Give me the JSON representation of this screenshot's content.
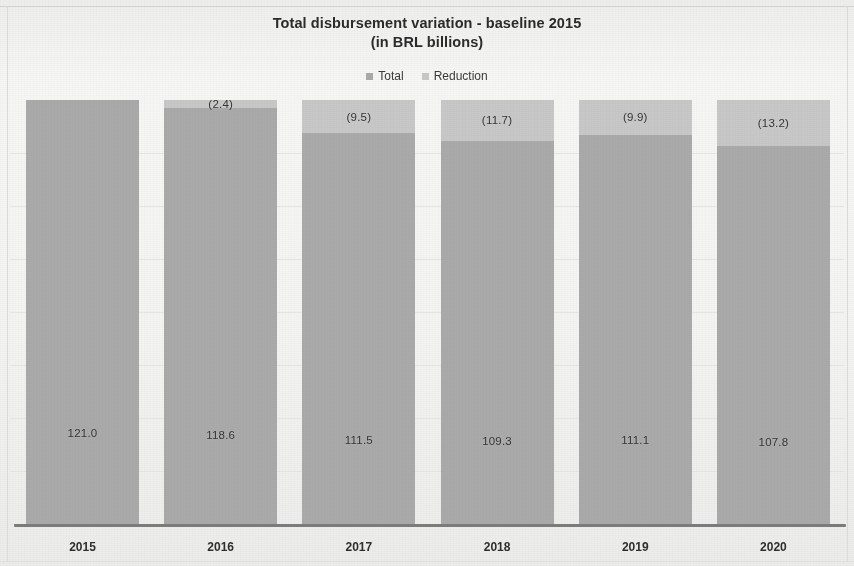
{
  "chart_data": {
    "type": "bar",
    "subtype": "stacked-column",
    "title": "Total disbursement variation - baseline 2015",
    "subtitle": "(in BRL billions)",
    "xlabel": "",
    "ylabel": "",
    "ylim": [
      0,
      121
    ],
    "grid": true,
    "legend_position": "top",
    "categories": [
      "2015",
      "2016",
      "2017",
      "2018",
      "2019",
      "2020"
    ],
    "series": [
      {
        "name": "Total",
        "color": "#aaaaaa",
        "values": [
          121.0,
          118.6,
          111.5,
          109.3,
          111.1,
          107.8
        ],
        "labels": [
          "121.0",
          "118.6",
          "111.5",
          "109.3",
          "111.1",
          "107.8"
        ]
      },
      {
        "name": "Reduction",
        "color": "#c8c8c8",
        "values": [
          0.0,
          2.4,
          9.5,
          11.7,
          9.9,
          13.2
        ],
        "labels": [
          "",
          "(2.4)",
          "(9.5)",
          "(11.7)",
          "(9.9)",
          "(13.2)"
        ]
      }
    ],
    "stack_total": 121.0
  },
  "title": {
    "line1": "Total disbursement variation - baseline 2015",
    "line2": "(in BRL billions)"
  },
  "legend": {
    "items": [
      {
        "label": "Total",
        "color": "#aaaaaa"
      },
      {
        "label": "Reduction",
        "color": "#c8c8c8"
      }
    ]
  },
  "axis": {
    "ticks": [
      "2015",
      "2016",
      "2017",
      "2018",
      "2019",
      "2020"
    ]
  },
  "bars": [
    {
      "category": "2015",
      "reduction_label": "",
      "total_label": "121.0"
    },
    {
      "category": "2016",
      "reduction_label": "(2.4)",
      "total_label": "118.6"
    },
    {
      "category": "2017",
      "reduction_label": "(9.5)",
      "total_label": "111.5"
    },
    {
      "category": "2018",
      "reduction_label": "(11.7)",
      "total_label": "109.3"
    },
    {
      "category": "2019",
      "reduction_label": "(9.9)",
      "total_label": "111.1"
    },
    {
      "category": "2020",
      "reduction_label": "(13.2)",
      "total_label": "107.8"
    }
  ]
}
